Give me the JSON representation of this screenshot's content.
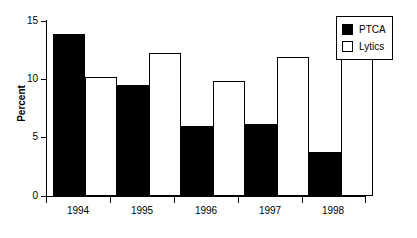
{
  "chart_data": {
    "type": "bar",
    "title": "",
    "subtitle": "",
    "xlabel": "",
    "ylabel": "Percent",
    "categories": [
      "1994",
      "1995",
      "1996",
      "1997",
      "1998"
    ],
    "series": [
      {
        "name": "PTCA",
        "values": [
          13.9,
          9.5,
          6.0,
          6.2,
          3.8
        ],
        "color": "#000000",
        "fill": "solid"
      },
      {
        "name": "Lytics",
        "values": [
          10.2,
          12.3,
          9.9,
          11.9,
          12.7
        ],
        "color": "#ffffff",
        "fill": "hollow"
      }
    ],
    "ylim": [
      0,
      15
    ],
    "ytick_values": [
      0,
      5,
      10,
      15
    ],
    "ytick_labels": [
      "0",
      "5",
      "10",
      "15"
    ],
    "grid": false,
    "legend_position": "top-right",
    "axis_color": "#000000",
    "background_color": "#ffffff"
  },
  "legend": {
    "items": [
      {
        "label": "PTCA",
        "swatch": "filled-square-icon"
      },
      {
        "label": "Lytics",
        "swatch": "hollow-square-icon"
      }
    ]
  }
}
